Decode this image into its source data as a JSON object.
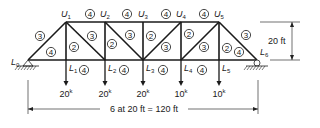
{
  "nodes": {
    "L0": {
      "x": 28,
      "y": 60,
      "label": "L",
      "sub": "0",
      "lx": 11,
      "ly": 65
    },
    "L1": {
      "x": 66,
      "y": 60,
      "label": "L",
      "sub": "1",
      "lx": 69,
      "ly": 71
    },
    "L2": {
      "x": 105,
      "y": 60,
      "label": "L",
      "sub": "2",
      "lx": 108,
      "ly": 71
    },
    "L3": {
      "x": 143,
      "y": 60,
      "label": "L",
      "sub": "3",
      "lx": 146,
      "ly": 71
    },
    "L4": {
      "x": 181,
      "y": 60,
      "label": "L",
      "sub": "4",
      "lx": 184,
      "ly": 71
    },
    "L5": {
      "x": 219,
      "y": 60,
      "label": "L",
      "sub": "5",
      "lx": 222,
      "ly": 71
    },
    "L6": {
      "x": 257,
      "y": 60,
      "label": "L",
      "sub": "6",
      "lx": 260,
      "ly": 55
    },
    "U1": {
      "x": 66,
      "y": 22,
      "label": "U",
      "sub": "1",
      "lx": 61,
      "ly": 17
    },
    "U2": {
      "x": 105,
      "y": 22,
      "label": "U",
      "sub": "2",
      "lx": 100,
      "ly": 17
    },
    "U3": {
      "x": 143,
      "y": 22,
      "label": "U",
      "sub": "3",
      "lx": 138,
      "ly": 17
    },
    "U4": {
      "x": 181,
      "y": 22,
      "label": "U",
      "sub": "4",
      "lx": 176,
      "ly": 17
    },
    "U5": {
      "x": 219,
      "y": 22,
      "label": "U",
      "sub": "5",
      "lx": 214,
      "ly": 17
    }
  },
  "members": [
    [
      "L0",
      "L6"
    ],
    [
      "U1",
      "U5"
    ],
    [
      "L0",
      "U1"
    ],
    [
      "U5",
      "L6"
    ],
    [
      "U1",
      "L1"
    ],
    [
      "U2",
      "L2"
    ],
    [
      "U3",
      "L3"
    ],
    [
      "U4",
      "L4"
    ],
    [
      "U5",
      "L5"
    ],
    [
      "U1",
      "L2"
    ],
    [
      "U2",
      "L3"
    ],
    [
      "U4",
      "L3"
    ],
    [
      "U5",
      "L4"
    ]
  ],
  "member_groups": [
    {
      "group": "4",
      "x": 90,
      "y": 14
    },
    {
      "group": "4",
      "x": 127,
      "y": 14
    },
    {
      "group": "4",
      "x": 166,
      "y": 14
    },
    {
      "group": "4",
      "x": 204,
      "y": 14
    },
    {
      "group": "3",
      "x": 40,
      "y": 36
    },
    {
      "group": "4",
      "x": 51,
      "y": 52
    },
    {
      "group": "2",
      "x": 74,
      "y": 47
    },
    {
      "group": "3",
      "x": 92,
      "y": 36
    },
    {
      "group": "2",
      "x": 112,
      "y": 44
    },
    {
      "group": "3",
      "x": 130,
      "y": 35
    },
    {
      "group": "2",
      "x": 151,
      "y": 36
    },
    {
      "group": "3",
      "x": 166,
      "y": 47
    },
    {
      "group": "2",
      "x": 189,
      "y": 34
    },
    {
      "group": "3",
      "x": 204,
      "y": 47
    },
    {
      "group": "3",
      "x": 246,
      "y": 35
    },
    {
      "group": "2",
      "x": 227,
      "y": 48
    },
    {
      "group": "4",
      "x": 239,
      "y": 52
    },
    {
      "group": "4",
      "x": 84,
      "y": 70
    },
    {
      "group": "4",
      "x": 124,
      "y": 70
    },
    {
      "group": "4",
      "x": 163,
      "y": 70
    },
    {
      "group": "4",
      "x": 202,
      "y": 70
    }
  ],
  "loads": [
    {
      "node": "L1",
      "value": "20",
      "unit": "k"
    },
    {
      "node": "L2",
      "value": "20",
      "unit": "k"
    },
    {
      "node": "L3",
      "value": "20",
      "unit": "k"
    },
    {
      "node": "L4",
      "value": "10",
      "unit": "k"
    },
    {
      "node": "L5",
      "value": "10",
      "unit": "k"
    }
  ],
  "dimensions": {
    "height_label": "20 ft",
    "span_label": "6 at 20 ft = 120 ft"
  },
  "supports": [
    {
      "node": "L0",
      "type": "pin"
    },
    {
      "node": "L6",
      "type": "roller"
    }
  ]
}
